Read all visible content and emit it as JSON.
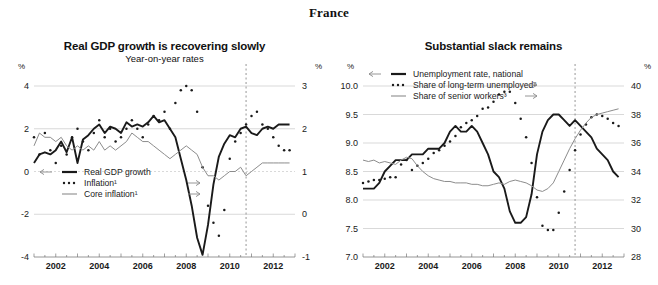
{
  "page": {
    "title": "France"
  },
  "units": {
    "left": "%",
    "right": "%"
  },
  "panels": [
    {
      "id": "real-gdp-growth",
      "title": "Real GDP growth is recovering slowly",
      "subtitle": "Year-on-year rates",
      "legend": [
        {
          "label": "Real GDP growth",
          "style": "solid-thick",
          "color": "#1a1a1a",
          "arrow": "left"
        },
        {
          "label": "Inflation¹",
          "style": "dotted",
          "color": "#1a1a1a",
          "arrow": "right"
        },
        {
          "label": "Core inflation¹",
          "style": "solid-thin",
          "color": "#8c8c8c",
          "arrow": "right"
        }
      ]
    },
    {
      "id": "substantial-slack",
      "title": "Substantial slack remains",
      "subtitle": "",
      "legend": [
        {
          "label": "Unemployment rate, national",
          "style": "solid-thick",
          "color": "#1a1a1a",
          "arrow": "left"
        },
        {
          "label": "Share of long-term unemployed²",
          "style": "dotted",
          "color": "#1a1a1a",
          "arrow": "right"
        },
        {
          "label": "Share of senior workers³",
          "style": "solid-thin",
          "color": "#8c8c8c",
          "arrow": "right"
        }
      ]
    }
  ],
  "chart_data": [
    {
      "type": "line",
      "id": "real-gdp-growth",
      "title": "Real GDP growth is recovering slowly",
      "subtitle": "Year-on-year rates",
      "xlabel": "",
      "ylabel": "%",
      "y2label": "%",
      "grid": true,
      "legend_position": "bottom-left",
      "xlim": [
        2001.0,
        2013.0
      ],
      "xticks": [
        2002,
        2004,
        2006,
        2008,
        2010,
        2012
      ],
      "ylim": [
        -4,
        4
      ],
      "yticks": [
        -4,
        -2,
        0,
        2,
        4
      ],
      "y2lim": [
        -1,
        3
      ],
      "y2ticks": [
        -1,
        0,
        1,
        2,
        3
      ],
      "forecast_line_x": 2010.75,
      "x": [
        2001.0,
        2001.25,
        2001.5,
        2001.75,
        2002.0,
        2002.25,
        2002.5,
        2002.75,
        2003.0,
        2003.25,
        2003.5,
        2003.75,
        2004.0,
        2004.25,
        2004.5,
        2004.75,
        2005.0,
        2005.25,
        2005.5,
        2005.75,
        2006.0,
        2006.25,
        2006.5,
        2006.75,
        2007.0,
        2007.25,
        2007.5,
        2007.75,
        2008.0,
        2008.25,
        2008.5,
        2008.75,
        2009.0,
        2009.25,
        2009.5,
        2009.75,
        2010.0,
        2010.25,
        2010.5,
        2010.75,
        2011.0,
        2011.25,
        2011.5,
        2011.75,
        2012.0,
        2012.25,
        2012.5,
        2012.75
      ],
      "series": [
        {
          "name": "Real GDP growth",
          "axis": "left",
          "style": "solid-thick",
          "color": "#1a1a1a",
          "values": [
            0.4,
            0.8,
            0.9,
            0.8,
            1.0,
            1.4,
            0.9,
            1.6,
            0.4,
            1.5,
            1.7,
            2.0,
            2.2,
            1.8,
            2.1,
            2.0,
            1.8,
            2.3,
            2.1,
            2.2,
            2.1,
            2.3,
            2.6,
            2.3,
            2.4,
            2.0,
            1.6,
            0.6,
            -0.4,
            -1.6,
            -3.1,
            -3.9,
            -2.5,
            -0.6,
            0.7,
            1.3,
            1.7,
            1.6,
            2.0,
            2.1,
            1.8,
            1.7,
            2.0,
            2.1,
            2.0,
            2.2,
            2.2,
            2.2
          ]
        },
        {
          "name": "Inflation¹",
          "axis": "right",
          "style": "dotted",
          "color": "#1a1a1a",
          "values": [
            1.8,
            1.4,
            1.9,
            1.5,
            1.2,
            1.6,
            1.4,
            1.8,
            2.0,
            1.7,
            1.5,
            1.9,
            2.2,
            1.8,
            2.0,
            1.7,
            1.8,
            2.0,
            2.2,
            2.0,
            1.8,
            2.1,
            2.3,
            2.2,
            2.4,
            2.0,
            2.6,
            2.9,
            3.0,
            2.9,
            2.4,
            1.1,
            0.2,
            -0.2,
            -0.5,
            0.1,
            1.3,
            1.7,
            1.9,
            2.1,
            2.3,
            2.4,
            2.1,
            2.0,
            1.8,
            1.6,
            1.5,
            1.5
          ]
        },
        {
          "name": "Core inflation¹",
          "axis": "right",
          "style": "solid-thin",
          "color": "#8c8c8c",
          "values": [
            1.6,
            1.9,
            1.8,
            1.8,
            1.7,
            1.8,
            1.6,
            1.5,
            1.6,
            1.5,
            1.6,
            1.5,
            1.7,
            1.5,
            1.6,
            1.5,
            1.6,
            1.7,
            1.9,
            1.8,
            1.7,
            1.7,
            1.6,
            1.5,
            1.4,
            1.3,
            1.4,
            1.5,
            1.6,
            1.5,
            1.4,
            1.1,
            0.9,
            0.9,
            0.8,
            0.9,
            1.0,
            1.0,
            1.1,
            0.9,
            1.0,
            1.1,
            1.2,
            1.2,
            1.2,
            1.2,
            1.2,
            1.2
          ]
        }
      ]
    },
    {
      "type": "line",
      "id": "substantial-slack",
      "title": "Substantial slack remains",
      "subtitle": "",
      "xlabel": "",
      "ylabel": "%",
      "y2label": "%",
      "grid": true,
      "legend_position": "top-left",
      "xlim": [
        2001.0,
        2013.0
      ],
      "xticks": [
        2002,
        2004,
        2006,
        2008,
        2010,
        2012
      ],
      "ylim": [
        7.0,
        10.0
      ],
      "yticks": [
        7.0,
        7.5,
        8.0,
        8.5,
        9.0,
        9.5,
        10.0
      ],
      "y2lim": [
        28,
        40
      ],
      "y2ticks": [
        28,
        30,
        32,
        34,
        36,
        38,
        40
      ],
      "forecast_line_x": 2010.75,
      "x": [
        2001.0,
        2001.25,
        2001.5,
        2001.75,
        2002.0,
        2002.25,
        2002.5,
        2002.75,
        2003.0,
        2003.25,
        2003.5,
        2003.75,
        2004.0,
        2004.25,
        2004.5,
        2004.75,
        2005.0,
        2005.25,
        2005.5,
        2005.75,
        2006.0,
        2006.25,
        2006.5,
        2006.75,
        2007.0,
        2007.25,
        2007.5,
        2007.75,
        2008.0,
        2008.25,
        2008.5,
        2008.75,
        2009.0,
        2009.25,
        2009.5,
        2009.75,
        2010.0,
        2010.25,
        2010.5,
        2010.75,
        2011.0,
        2011.25,
        2011.5,
        2011.75,
        2012.0,
        2012.25,
        2012.5,
        2012.75
      ],
      "series": [
        {
          "name": "Unemployment rate, national",
          "axis": "left",
          "style": "solid-thick",
          "color": "#1a1a1a",
          "values": [
            8.2,
            8.2,
            8.2,
            8.3,
            8.5,
            8.6,
            8.7,
            8.7,
            8.7,
            8.8,
            8.8,
            8.8,
            8.9,
            8.9,
            8.9,
            9.0,
            9.2,
            9.3,
            9.2,
            9.2,
            9.3,
            9.2,
            9.0,
            8.8,
            8.5,
            8.4,
            8.2,
            7.8,
            7.6,
            7.6,
            7.7,
            8.1,
            8.8,
            9.2,
            9.4,
            9.5,
            9.5,
            9.4,
            9.3,
            9.4,
            9.3,
            9.2,
            9.1,
            8.9,
            8.8,
            8.7,
            8.5,
            8.4
          ]
        },
        {
          "name": "Share of long-term unemployed²",
          "axis": "right",
          "style": "dotted",
          "color": "#1a1a1a",
          "values": [
            33.2,
            33.3,
            33.4,
            33.4,
            33.5,
            33.6,
            33.6,
            34.5,
            34.8,
            34.1,
            34.4,
            34.6,
            34.9,
            35.3,
            35.5,
            35.8,
            36.1,
            36.5,
            37.1,
            37.4,
            37.6,
            37.9,
            38.4,
            38.5,
            38.9,
            39.4,
            39.6,
            39.6,
            38.8,
            37.7,
            36.4,
            34.6,
            32.2,
            30.2,
            29.9,
            29.9,
            31.1,
            32.6,
            34.1,
            35.5,
            36.6,
            37.3,
            37.8,
            38.0,
            37.9,
            37.7,
            37.4,
            37.2
          ]
        },
        {
          "name": "Share of senior workers³",
          "axis": "right",
          "style": "solid-thin",
          "color": "#8c8c8c",
          "values": [
            34.8,
            34.7,
            34.8,
            34.6,
            34.7,
            34.6,
            34.5,
            34.8,
            35.0,
            34.9,
            34.4,
            34.0,
            33.7,
            33.5,
            33.4,
            33.3,
            33.3,
            33.2,
            33.2,
            33.2,
            33.1,
            33.1,
            33.0,
            33.0,
            33.1,
            33.2,
            33.1,
            33.3,
            33.4,
            33.3,
            33.2,
            33.0,
            32.7,
            32.6,
            32.8,
            33.2,
            34.0,
            34.8,
            35.6,
            36.3,
            36.9,
            37.4,
            37.8,
            38.0,
            38.1,
            38.2,
            38.3,
            38.4
          ]
        }
      ]
    }
  ]
}
